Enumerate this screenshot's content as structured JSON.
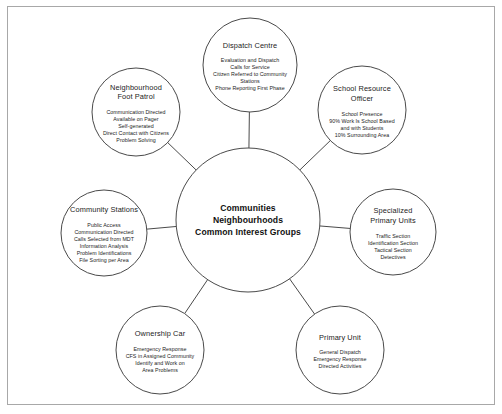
{
  "diagram": {
    "type": "hub-and-spoke",
    "frame": {
      "border_color": "#a8a8a8",
      "background": "#ffffff"
    },
    "stroke_color": "#4a4a4a",
    "text_color": "#1c1c1c",
    "hub": {
      "name": "communities-hub",
      "cx": 248,
      "cy": 220,
      "r": 72,
      "lines": [
        "Communities",
        "Neighbourhoods",
        "Common Interest Groups"
      ]
    },
    "nodes": [
      {
        "id": "dispatch-centre",
        "cx": 250,
        "cy": 65,
        "r": 47,
        "title": [
          "Dispatch Centre"
        ],
        "details": [
          "Evaluation and Dispatch",
          "Calls for Service",
          "Citizen Referred to Community",
          "Stations",
          "Phone Reporting First Phase"
        ]
      },
      {
        "id": "neighbourhood-foot-patrol",
        "cx": 136,
        "cy": 112,
        "r": 44,
        "title": [
          "Neighbourhood",
          "Foot Patrol"
        ],
        "details": [
          "Communication Directed",
          "Available on Pager",
          "Self-generated",
          "Direct Contact with Citizens",
          "Problem Solving"
        ]
      },
      {
        "id": "school-resource-officer",
        "cx": 362,
        "cy": 110,
        "r": 44,
        "title": [
          "School Resource",
          "Officer"
        ],
        "details": [
          "School Presence",
          "90% Work Is School Based",
          "and with Students",
          "10% Surrounding Area"
        ]
      },
      {
        "id": "community-stations",
        "cx": 104,
        "cy": 233,
        "r": 43,
        "title": [
          "Community Stations"
        ],
        "details": [
          "Public Access",
          "Communication Directed",
          "Calls Selected from MDT",
          "Information Analysis",
          "Problem Identifications",
          "File Sorting per Area"
        ]
      },
      {
        "id": "specialized-primary-units",
        "cx": 393,
        "cy": 232,
        "r": 43,
        "title": [
          "Specialized",
          "Primary Units"
        ],
        "details": [
          "Traffic Section",
          "Identification Section",
          "Tactical Section",
          "Detectives"
        ]
      },
      {
        "id": "ownership-car",
        "cx": 160,
        "cy": 350,
        "r": 44,
        "title": [
          "Ownership Car"
        ],
        "details": [
          "Emergency Response",
          "CFS in Assigned Community",
          "Identify and Work on",
          "Area Problems"
        ]
      },
      {
        "id": "primary-unit",
        "cx": 340,
        "cy": 350,
        "r": 44,
        "title": [
          "Primary Unit"
        ],
        "details": [
          "General Dispatch",
          "Emergency Response",
          "Directed Activities"
        ]
      }
    ]
  }
}
